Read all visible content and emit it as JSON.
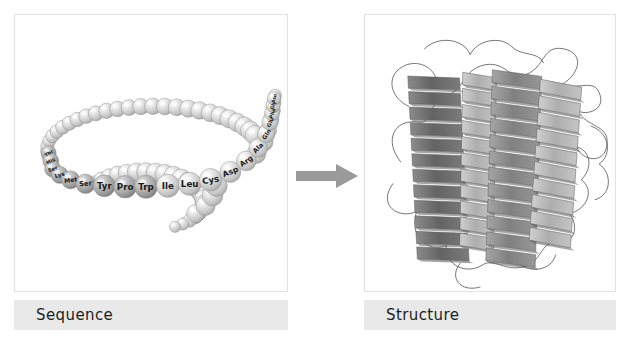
{
  "figure": {
    "background_color": "#ffffff",
    "panel_border_color": "#e2e2e2",
    "caption_bar_color": "#e9e9e9",
    "arrow_color": "#9a9a9a"
  },
  "panels": {
    "sequence": {
      "caption": "Sequence",
      "bead_color_light": "#d4d4d4",
      "bead_color_dark": "#9d9d9d",
      "labels": [
        "Thr",
        "His",
        "Ser",
        "Lys",
        "Met",
        "Ser",
        "Tyr",
        "Pro",
        "Trp",
        "Ile",
        "Leu",
        "Cys",
        "Asp",
        "Arg",
        "Ala",
        "Gln",
        "Glu",
        "Phe",
        "Gly",
        "Asn"
      ],
      "labeled_beads": [
        {
          "label": "Thr",
          "x": 34,
          "y": 139,
          "r": 7.5,
          "font": 5.0,
          "shade": "dark",
          "rot": -34
        },
        {
          "label": "His",
          "x": 36,
          "y": 147,
          "r": 8.0,
          "font": 5.2,
          "shade": "dark",
          "rot": -28
        },
        {
          "label": "Ser",
          "x": 38,
          "y": 155,
          "r": 8.2,
          "font": 5.2,
          "shade": "dark",
          "rot": -20
        },
        {
          "label": "Lys",
          "x": 45,
          "y": 161,
          "r": 8.6,
          "font": 5.6,
          "shade": "dark",
          "rot": -14
        },
        {
          "label": "Met",
          "x": 56,
          "y": 166,
          "r": 9.2,
          "font": 6.2,
          "shade": "dark",
          "rot": -8
        },
        {
          "label": "Ser",
          "x": 71,
          "y": 170,
          "r": 9.8,
          "font": 6.8,
          "shade": "dark",
          "rot": -4
        },
        {
          "label": "Tyr",
          "x": 90,
          "y": 172,
          "r": 11.0,
          "font": 8.6,
          "shade": "dark",
          "rot": 0
        },
        {
          "label": "Pro",
          "x": 111,
          "y": 173,
          "r": 11.4,
          "font": 8.8,
          "shade": "dark",
          "rot": 0
        },
        {
          "label": "Trp",
          "x": 132,
          "y": 173,
          "r": 11.6,
          "font": 8.8,
          "shade": "dark",
          "rot": 0
        },
        {
          "label": "Ile",
          "x": 154,
          "y": 172,
          "r": 11.6,
          "font": 8.8,
          "shade": "light",
          "rot": 0
        },
        {
          "label": "Leu",
          "x": 176,
          "y": 170,
          "r": 11.6,
          "font": 8.8,
          "shade": "light",
          "rot": 0
        },
        {
          "label": "Cys",
          "x": 197,
          "y": 166,
          "r": 11.4,
          "font": 8.6,
          "shade": "light",
          "rot": -10
        },
        {
          "label": "Asp",
          "x": 217,
          "y": 158,
          "r": 10.6,
          "font": 7.8,
          "shade": "light",
          "rot": -22
        },
        {
          "label": "Arg",
          "x": 233,
          "y": 147,
          "r": 10.0,
          "font": 7.2,
          "shade": "light",
          "rot": -34
        },
        {
          "label": "Ala",
          "x": 245,
          "y": 134,
          "r": 9.4,
          "font": 6.6,
          "shade": "light",
          "rot": -46
        },
        {
          "label": "Gln",
          "x": 253,
          "y": 120,
          "r": 8.8,
          "font": 6.0,
          "shade": "light",
          "rot": -58
        },
        {
          "label": "Glu",
          "x": 257,
          "y": 108,
          "r": 8.2,
          "font": 5.4,
          "shade": "light",
          "rot": -66
        },
        {
          "label": "Phe",
          "x": 259,
          "y": 99,
          "r": 7.6,
          "font": 5.0,
          "shade": "light",
          "rot": -70
        },
        {
          "label": "Gly",
          "x": 260,
          "y": 91,
          "r": 7.2,
          "font": 4.8,
          "shade": "light",
          "rot": -72
        },
        {
          "label": "Asn",
          "x": 261,
          "y": 84,
          "r": 6.8,
          "font": 4.6,
          "shade": "light",
          "rot": -74
        }
      ]
    },
    "structure": {
      "caption": "Structure",
      "helix_color_dark": "#6e6e6e",
      "helix_color_mid": "#8f8f8f",
      "helix_color_light": "#b6b6b6",
      "loop_color": "#4a4a4a",
      "helix_count": 4
    }
  }
}
